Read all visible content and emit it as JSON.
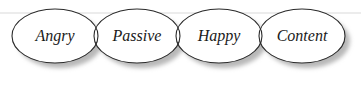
{
  "diagram": {
    "type": "overlapping-ellipses",
    "nodes": [
      {
        "label": "Angry",
        "cx": 55,
        "cy": 36
      },
      {
        "label": "Passive",
        "cx": 137,
        "cy": 36
      },
      {
        "label": "Happy",
        "cx": 219,
        "cy": 36
      },
      {
        "label": "Content",
        "cx": 302,
        "cy": 36
      }
    ],
    "colors": {
      "stroke": "#2a2a2a",
      "fill": "#ffffff",
      "shadow": "#bdbdbd",
      "rule": "#e6e6e6"
    }
  }
}
